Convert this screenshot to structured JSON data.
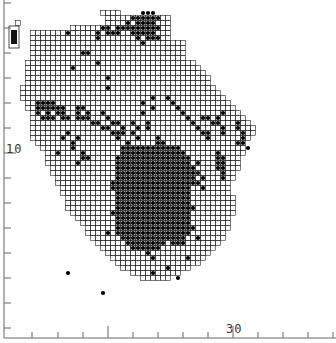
{
  "map": {
    "cell_size": 5,
    "origin_x": 15,
    "origin_y": 10,
    "line_color": "#222222",
    "dot_color": "#000000",
    "land_rows": [
      [
        0,
        17,
        20
      ],
      [
        1,
        18,
        30
      ],
      [
        2,
        18,
        30
      ],
      [
        3,
        18,
        30
      ],
      [
        4,
        18,
        30
      ],
      [
        5,
        18,
        30
      ],
      [
        2,
        0,
        0
      ],
      [
        3,
        11,
        17
      ],
      [
        4,
        3,
        17
      ],
      [
        5,
        3,
        17
      ],
      [
        6,
        3,
        33
      ],
      [
        7,
        3,
        33
      ],
      [
        8,
        3,
        33
      ],
      [
        9,
        3,
        33
      ],
      [
        10,
        2,
        35
      ],
      [
        11,
        2,
        36
      ],
      [
        12,
        2,
        37
      ],
      [
        13,
        2,
        38
      ],
      [
        14,
        2,
        38
      ],
      [
        15,
        1,
        39
      ],
      [
        16,
        1,
        40
      ],
      [
        17,
        1,
        41
      ],
      [
        18,
        2,
        42
      ],
      [
        19,
        2,
        43
      ],
      [
        20,
        3,
        44
      ],
      [
        21,
        3,
        45
      ],
      [
        22,
        3,
        46
      ],
      [
        23,
        3,
        47
      ],
      [
        24,
        3,
        47
      ],
      [
        25,
        3,
        46
      ],
      [
        26,
        4,
        45
      ],
      [
        27,
        5,
        45
      ],
      [
        28,
        6,
        45
      ],
      [
        29,
        6,
        44
      ],
      [
        30,
        6,
        44
      ],
      [
        31,
        7,
        44
      ],
      [
        32,
        7,
        43
      ],
      [
        33,
        8,
        43
      ],
      [
        34,
        8,
        42
      ],
      [
        35,
        9,
        42
      ],
      [
        36,
        9,
        42
      ],
      [
        37,
        10,
        43
      ],
      [
        38,
        10,
        43
      ],
      [
        39,
        10,
        43
      ],
      [
        40,
        11,
        43
      ],
      [
        41,
        12,
        42
      ],
      [
        42,
        13,
        42
      ],
      [
        43,
        14,
        42
      ],
      [
        44,
        14,
        41
      ],
      [
        45,
        15,
        41
      ],
      [
        46,
        16,
        40
      ],
      [
        47,
        17,
        39
      ],
      [
        48,
        18,
        38
      ],
      [
        49,
        19,
        37
      ],
      [
        50,
        20,
        36
      ],
      [
        51,
        21,
        34
      ],
      [
        52,
        23,
        32
      ],
      [
        53,
        25,
        30
      ]
    ],
    "legend_box": {
      "x": 9,
      "y": 26,
      "w": 10,
      "h": 22
    },
    "dots": [
      [
        0,
        25
      ],
      [
        0,
        26
      ],
      [
        0,
        27
      ],
      [
        1,
        23
      ],
      [
        1,
        24
      ],
      [
        1,
        25
      ],
      [
        1,
        26
      ],
      [
        1,
        27
      ],
      [
        1,
        28
      ],
      [
        2,
        22
      ],
      [
        2,
        24
      ],
      [
        2,
        25
      ],
      [
        2,
        26
      ],
      [
        2,
        27
      ],
      [
        3,
        22
      ],
      [
        3,
        23
      ],
      [
        3,
        24
      ],
      [
        3,
        25
      ],
      [
        3,
        26
      ],
      [
        3,
        27
      ],
      [
        3,
        28
      ],
      [
        4,
        23
      ],
      [
        4,
        24
      ],
      [
        4,
        25
      ],
      [
        4,
        26
      ],
      [
        4,
        27
      ],
      [
        5,
        24
      ],
      [
        5,
        26
      ],
      [
        5,
        27
      ],
      [
        5,
        28
      ],
      [
        3,
        17
      ],
      [
        3,
        18
      ],
      [
        3,
        20
      ],
      [
        3,
        21
      ],
      [
        4,
        16
      ],
      [
        4,
        18
      ],
      [
        4,
        19
      ],
      [
        4,
        20
      ],
      [
        5,
        16
      ],
      [
        8,
        13
      ],
      [
        8,
        14
      ],
      [
        11,
        11
      ],
      [
        13,
        18
      ],
      [
        15,
        18
      ],
      [
        17,
        27
      ],
      [
        18,
        25
      ],
      [
        19,
        27
      ],
      [
        20,
        25
      ],
      [
        22,
        26
      ],
      [
        23,
        26
      ],
      [
        17,
        30
      ],
      [
        18,
        31
      ],
      [
        19,
        32
      ],
      [
        20,
        33
      ],
      [
        21,
        34
      ],
      [
        22,
        35
      ],
      [
        23,
        36
      ],
      [
        24,
        37
      ],
      [
        24,
        38
      ],
      [
        25,
        38
      ],
      [
        4,
        10
      ],
      [
        6,
        25
      ],
      [
        10,
        16
      ],
      [
        18,
        4
      ],
      [
        18,
        5
      ],
      [
        18,
        6
      ],
      [
        18,
        7
      ],
      [
        19,
        4
      ],
      [
        19,
        5
      ],
      [
        19,
        6
      ],
      [
        19,
        7
      ],
      [
        19,
        8
      ],
      [
        19,
        9
      ],
      [
        20,
        4
      ],
      [
        20,
        6
      ],
      [
        20,
        8
      ],
      [
        20,
        9
      ],
      [
        21,
        5
      ],
      [
        21,
        6
      ],
      [
        21,
        7
      ],
      [
        21,
        9
      ],
      [
        21,
        10
      ],
      [
        19,
        12
      ],
      [
        19,
        13
      ],
      [
        20,
        12
      ],
      [
        20,
        14
      ],
      [
        21,
        12
      ],
      [
        21,
        13
      ],
      [
        21,
        14
      ],
      [
        22,
        15
      ],
      [
        22,
        16
      ],
      [
        23,
        17
      ],
      [
        23,
        18
      ],
      [
        22,
        20
      ],
      [
        23,
        21
      ],
      [
        24,
        21
      ],
      [
        22,
        23
      ],
      [
        24,
        23
      ],
      [
        23,
        24
      ],
      [
        25,
        24
      ],
      [
        20,
        17
      ],
      [
        21,
        18
      ],
      [
        22,
        19
      ],
      [
        24,
        19
      ],
      [
        24,
        20
      ],
      [
        25,
        20
      ],
      [
        26,
        22
      ],
      [
        27,
        21
      ],
      [
        27,
        22
      ],
      [
        28,
        22
      ],
      [
        24,
        10
      ],
      [
        25,
        9
      ],
      [
        25,
        12
      ],
      [
        26,
        11
      ],
      [
        27,
        11
      ],
      [
        28,
        8
      ],
      [
        28,
        13
      ],
      [
        29,
        13
      ],
      [
        29,
        14
      ],
      [
        30,
        12
      ],
      [
        21,
        37
      ],
      [
        21,
        38
      ],
      [
        22,
        39
      ],
      [
        22,
        40
      ],
      [
        21,
        40
      ],
      [
        20,
        41
      ],
      [
        23,
        41
      ],
      [
        24,
        41
      ],
      [
        22,
        44
      ],
      [
        23,
        44
      ],
      [
        24,
        45
      ],
      [
        25,
        45
      ],
      [
        26,
        44
      ],
      [
        26,
        45
      ],
      [
        27,
        46
      ],
      [
        28,
        40
      ],
      [
        29,
        40
      ],
      [
        30,
        40
      ],
      [
        31,
        40
      ],
      [
        29,
        41
      ],
      [
        30,
        41
      ],
      [
        31,
        41
      ],
      [
        32,
        41
      ],
      [
        33,
        41
      ],
      [
        31,
        35
      ],
      [
        32,
        35
      ],
      [
        33,
        35
      ],
      [
        34,
        35
      ],
      [
        30,
        36
      ],
      [
        32,
        36
      ],
      [
        34,
        36
      ],
      [
        35,
        37
      ],
      [
        33,
        37
      ],
      [
        35,
        33
      ],
      [
        36,
        33
      ],
      [
        37,
        32
      ],
      [
        38,
        34
      ],
      [
        39,
        35
      ],
      [
        25,
        28
      ],
      [
        26,
        28
      ],
      [
        27,
        28
      ],
      [
        28,
        28
      ],
      [
        29,
        28
      ],
      [
        30,
        28
      ],
      [
        31,
        28
      ],
      [
        32,
        28
      ],
      [
        33,
        28
      ],
      [
        34,
        28
      ],
      [
        35,
        28
      ],
      [
        36,
        28
      ],
      [
        37,
        28
      ],
      [
        38,
        28
      ],
      [
        26,
        29
      ],
      [
        27,
        29
      ],
      [
        28,
        29
      ],
      [
        29,
        29
      ],
      [
        30,
        29
      ],
      [
        31,
        29
      ],
      [
        32,
        29
      ],
      [
        33,
        29
      ],
      [
        34,
        29
      ],
      [
        35,
        29
      ],
      [
        36,
        29
      ],
      [
        37,
        29
      ],
      [
        38,
        29
      ],
      [
        27,
        21
      ],
      [
        28,
        23
      ],
      [
        29,
        23
      ],
      [
        30,
        22
      ],
      [
        31,
        21
      ],
      [
        32,
        22
      ],
      [
        33,
        22
      ],
      [
        34,
        21
      ],
      [
        35,
        21
      ],
      [
        34,
        19
      ],
      [
        35,
        19
      ],
      [
        36,
        20
      ],
      [
        37,
        20
      ],
      [
        38,
        21
      ],
      [
        39,
        21
      ],
      [
        40,
        19
      ]
    ],
    "dense_block": {
      "row_start": 27,
      "row_end": 47,
      "col_start": 20,
      "col_end": 34
    },
    "dense_block_holes": [
      [
        27,
        20
      ],
      [
        27,
        21
      ],
      [
        28,
        20
      ],
      [
        27,
        33
      ],
      [
        27,
        34
      ],
      [
        28,
        34
      ],
      [
        45,
        20
      ],
      [
        46,
        20
      ],
      [
        46,
        21
      ],
      [
        47,
        20
      ],
      [
        47,
        21
      ],
      [
        47,
        22
      ],
      [
        46,
        30
      ],
      [
        47,
        29
      ],
      [
        47,
        30
      ],
      [
        47,
        31
      ],
      [
        47,
        32
      ],
      [
        47,
        33
      ],
      [
        47,
        34
      ],
      [
        46,
        34
      ],
      [
        45,
        34
      ]
    ],
    "scattered_lower": [
      [
        48,
        26
      ],
      [
        49,
        27
      ],
      [
        51,
        30
      ],
      [
        52,
        27
      ],
      [
        53,
        32
      ],
      [
        49,
        34
      ],
      [
        45,
        36
      ],
      [
        43,
        35
      ],
      [
        52,
        10
      ],
      [
        56,
        17
      ],
      [
        44,
        21
      ],
      [
        44,
        18
      ]
    ]
  },
  "axes": {
    "left_ticks_y": [
      3,
      28,
      53,
      78,
      103,
      128,
      153,
      178,
      203,
      228,
      253,
      278,
      303,
      328
    ],
    "left_long_tick_y": 153,
    "bottom_ticks_x": [
      32,
      58,
      83,
      108,
      133,
      158,
      183,
      208,
      233,
      258,
      283,
      308,
      333
    ],
    "bottom_long_ticks_x": [
      108,
      233
    ],
    "axis_x": 4,
    "axis_y": 338,
    "label_left": "10",
    "label_bottom": "30"
  }
}
